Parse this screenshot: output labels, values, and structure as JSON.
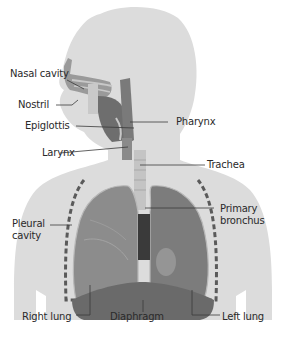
{
  "diagram": {
    "colors": {
      "silhouette": "#dcdcdc",
      "tissue_dark": "#6e6e6e",
      "tissue_mid": "#8c8c8c",
      "tissue_light": "#b4b4b4",
      "leader_line": "#3a3a3a",
      "label_text": "#2a2a2a"
    },
    "labels": {
      "nasal_cavity": "Nasal cavity",
      "nostril": "Nostril",
      "epiglottis": "Epiglottis",
      "larynx": "Larynx",
      "pharynx": "Pharynx",
      "trachea": "Trachea",
      "pleural_cavity": "Pleural cavity",
      "primary_bronchus": "Primary bronchus",
      "right_lung": "Right lung",
      "diaphragm": "Diaphragm",
      "left_lung": "Left lung"
    }
  }
}
